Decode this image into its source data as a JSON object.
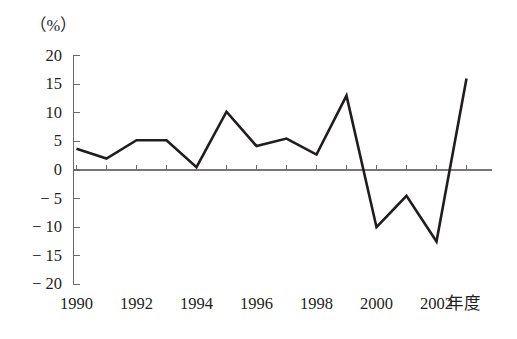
{
  "chart_data": {
    "type": "line",
    "title": "",
    "subtitle": "",
    "xlabel": "年度",
    "ylabel": "（%）",
    "x": [
      1990,
      1991,
      1992,
      1993,
      1994,
      1995,
      1996,
      1997,
      1998,
      1999,
      2000,
      2001,
      2002,
      2003
    ],
    "values": [
      3.7,
      2.0,
      5.2,
      5.2,
      0.5,
      10.2,
      4.2,
      5.5,
      2.7,
      13.0,
      -10.0,
      -4.5,
      -12.5,
      16.0
    ],
    "series": [
      {
        "name": "",
        "values": [
          3.7,
          2.0,
          5.2,
          5.2,
          0.5,
          10.2,
          4.2,
          5.5,
          2.7,
          13.0,
          -10.0,
          -4.5,
          -12.5,
          16.0
        ]
      }
    ],
    "xlim": [
      1990,
      2003
    ],
    "ylim": [
      -20,
      20
    ],
    "y_ticks": [
      20,
      15,
      10,
      5,
      0,
      -5,
      -10,
      -15,
      -20
    ],
    "y_tick_labels": [
      "20",
      "15",
      "10",
      "5",
      "0",
      "− 5",
      "− 10",
      "− 15",
      "− 20"
    ],
    "x_ticks": [
      1990,
      1992,
      1994,
      1996,
      1998,
      2000,
      2002
    ],
    "x_tick_labels": [
      "1990",
      "1992",
      "1994",
      "1996",
      "1998",
      "2000",
      "2002"
    ],
    "grid": false,
    "legend": false,
    "legend_position": "none",
    "line_color": "#201d1c",
    "axis_color": "#6e6a69",
    "background_color": "#ffffff"
  },
  "axis": {
    "unit_label": "（%）",
    "x_caption": "年度"
  }
}
